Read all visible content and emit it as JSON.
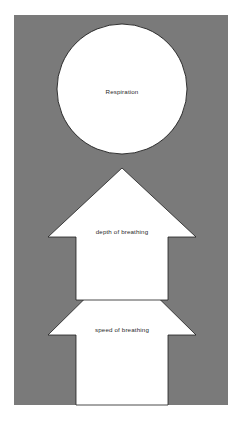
{
  "diagram": {
    "title": "Respiration",
    "canvas": {
      "width": 242,
      "height": 424,
      "background_color": "#ffffff"
    },
    "panel": {
      "label": "background-panel",
      "fill_color": "#7a7a7a",
      "x": 14,
      "y": 15,
      "width": 214,
      "height": 390
    },
    "nodes": [
      {
        "id": "respiration",
        "shape": "circle",
        "label": "Respiration",
        "fill_color": "#ffffff",
        "stroke_color": "#1e1e1e",
        "cx": 122,
        "cy": 89,
        "r": 65,
        "label_x": 122,
        "label_y": 92
      },
      {
        "id": "depth-of-breathing",
        "shape": "arrow-up",
        "label": "depth of breathing",
        "fill_color": "#ffffff",
        "stroke_color": "#1e1e1e",
        "points": "122,168 196,237 168,237 168,300 76,300 76,237 48,237",
        "label_x": 122,
        "label_y": 232
      },
      {
        "id": "speed-of-breathing",
        "shape": "arrow-up",
        "label": "speed of breathing",
        "fill_color": "#ffffff",
        "stroke_color": "#1e1e1e",
        "points": "122,262 196,335 168,335 168,405 76,405 76,335 48,335",
        "label_x": 122,
        "label_y": 330
      }
    ]
  }
}
